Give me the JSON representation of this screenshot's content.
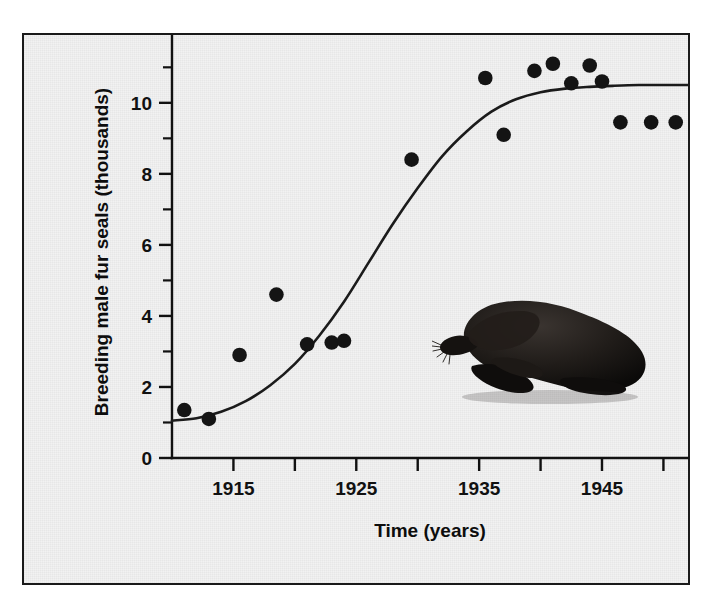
{
  "figure": {
    "background_color": "#f2f2f2",
    "border_color": "#1a1a1a",
    "point_color": "#141414",
    "curve_color": "#1b1b1b"
  },
  "illustration": {
    "name": "fur-seal-silhouette",
    "description": "Dark silhouette drawing of an adult male fur seal (bull) facing left with whiskers and fore/hind flippers",
    "color": "#111111"
  },
  "chart_data": {
    "type": "scatter",
    "title": "",
    "subtitle": "",
    "xlabel": "Time (years)",
    "ylabel": "Breeding male fur seals (thousands)",
    "xlim": [
      1910,
      1952
    ],
    "ylim": [
      0,
      11.6
    ],
    "grid": false,
    "legend": null,
    "x_ticks": [
      1910,
      1915,
      1920,
      1925,
      1930,
      1935,
      1940,
      1945,
      1950
    ],
    "x_tick_labels": [
      "",
      "1915",
      "",
      "1925",
      "",
      "1935",
      "",
      "1945",
      ""
    ],
    "y_ticks": [
      0,
      1,
      2,
      3,
      4,
      5,
      6,
      7,
      8,
      9,
      10,
      11
    ],
    "y_tick_labels": [
      "0",
      "",
      "2",
      "",
      "4",
      "",
      "6",
      "",
      "8",
      "",
      "10",
      ""
    ],
    "series": [
      {
        "name": "Breeding male fur seals",
        "type": "scatter",
        "marker": "filled-circle",
        "x": [
          1911,
          1913,
          1915.5,
          1918.5,
          1921,
          1923,
          1924,
          1929.5,
          1935.5,
          1937,
          1939.5,
          1941,
          1942.5,
          1944,
          1945,
          1946.5,
          1949,
          1951
        ],
        "y": [
          1.35,
          1.1,
          2.9,
          4.6,
          3.2,
          3.25,
          3.3,
          8.4,
          10.7,
          9.1,
          10.9,
          11.1,
          10.55,
          11.05,
          10.6,
          9.45,
          9.45,
          9.45
        ]
      },
      {
        "name": "Logistic fitted curve",
        "type": "line",
        "x": [
          1910,
          1912,
          1914,
          1916,
          1918,
          1920,
          1922,
          1924,
          1926,
          1928,
          1930,
          1932,
          1934,
          1936,
          1938,
          1940,
          1942,
          1944,
          1946,
          1948,
          1950,
          1952
        ],
        "y": [
          1.05,
          1.12,
          1.3,
          1.6,
          2.05,
          2.65,
          3.45,
          4.4,
          5.5,
          6.6,
          7.6,
          8.5,
          9.2,
          9.75,
          10.1,
          10.3,
          10.4,
          10.45,
          10.48,
          10.5,
          10.5,
          10.5
        ]
      }
    ]
  }
}
